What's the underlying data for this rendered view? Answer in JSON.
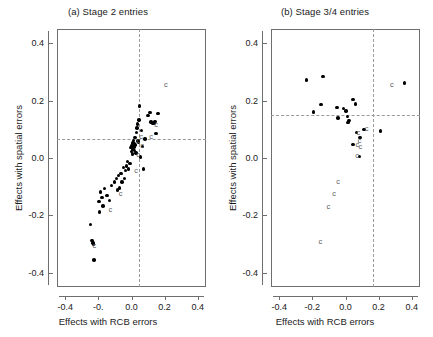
{
  "figure": {
    "width": 433,
    "height": 337,
    "background": "#ffffff",
    "point_color": "#000000",
    "label_color": "#5a5a5a",
    "axis_color": "#6e6e6e",
    "dash_color": "#9a9a9a"
  },
  "chart_data": [
    {
      "type": "scatter",
      "panel": "a",
      "title": "(a) Stage 2 entries",
      "xlabel": "Effects with RCB errors",
      "ylabel": "Effects with spatial errors",
      "xlim": [
        -0.45,
        0.45
      ],
      "ylim": [
        -0.45,
        0.45
      ],
      "xticks": [
        -0.4,
        -0.2,
        0.0,
        0.2,
        0.4
      ],
      "xticklabels": [
        "-0.4",
        "-0.",
        "0.0",
        "0.2",
        "0.4"
      ],
      "yticks": [
        -0.4,
        -0.2,
        0.0,
        0.2,
        0.4
      ],
      "yticklabels": [
        "-0.4",
        "-0.2",
        "0.0",
        "0.2",
        "0.4"
      ],
      "grid": false,
      "legend": "none",
      "reference_lines": {
        "vertical_x": 0.045,
        "horizontal_y": 0.068,
        "style": "dashed"
      },
      "points": [
        [
          -0.248,
          -0.232
        ],
        [
          -0.238,
          -0.288
        ],
        [
          -0.232,
          -0.297
        ],
        [
          -0.228,
          -0.302
        ],
        [
          -0.226,
          -0.356
        ],
        [
          -0.196,
          -0.152
        ],
        [
          -0.193,
          -0.188
        ],
        [
          -0.186,
          -0.118
        ],
        [
          -0.178,
          -0.137
        ],
        [
          -0.172,
          -0.168
        ],
        [
          -0.162,
          -0.106
        ],
        [
          -0.148,
          -0.131
        ],
        [
          -0.132,
          -0.148
        ],
        [
          -0.121,
          -0.096
        ],
        [
          -0.104,
          -0.084
        ],
        [
          -0.092,
          -0.072
        ],
        [
          -0.086,
          -0.112
        ],
        [
          -0.08,
          -0.061
        ],
        [
          -0.072,
          -0.104
        ],
        [
          -0.064,
          -0.054
        ],
        [
          -0.058,
          -0.084
        ],
        [
          -0.048,
          -0.034
        ],
        [
          -0.042,
          -0.071
        ],
        [
          -0.036,
          -0.044
        ],
        [
          -0.03,
          -0.028
        ],
        [
          -0.024,
          -0.012
        ],
        [
          -0.018,
          -0.038
        ],
        [
          -0.01,
          -0.019
        ],
        [
          -0.004,
          0.036
        ],
        [
          0.0,
          0.022
        ],
        [
          0.004,
          0.044
        ],
        [
          0.006,
          0.014
        ],
        [
          0.008,
          0.053
        ],
        [
          0.01,
          0.03
        ],
        [
          0.012,
          0.062
        ],
        [
          0.014,
          0.038
        ],
        [
          0.016,
          0.05
        ],
        [
          0.018,
          0.026
        ],
        [
          0.02,
          0.072
        ],
        [
          0.022,
          0.046
        ],
        [
          0.026,
          0.018
        ],
        [
          0.03,
          0.09
        ],
        [
          0.034,
          0.104
        ],
        [
          0.038,
          0.118
        ],
        [
          0.04,
          0.06
        ],
        [
          0.044,
          0.056
        ],
        [
          0.046,
          0.132
        ],
        [
          0.05,
          0.182
        ],
        [
          0.054,
          0.003
        ],
        [
          0.062,
          0.096
        ],
        [
          0.068,
          0.04
        ],
        [
          0.074,
          -0.038
        ],
        [
          0.082,
          0.066
        ],
        [
          0.1,
          0.148
        ],
        [
          0.112,
          0.158
        ],
        [
          0.118,
          0.126
        ],
        [
          0.128,
          0.12
        ],
        [
          0.136,
          0.122
        ],
        [
          0.142,
          0.128
        ],
        [
          0.148,
          0.086
        ],
        [
          0.16,
          0.156
        ]
      ],
      "char_labels": [
        {
          "text": "c",
          "x": 0.208,
          "y": 0.256
        },
        {
          "text": "c",
          "x": 0.148,
          "y": 0.116
        },
        {
          "text": "c",
          "x": 0.118,
          "y": 0.074
        },
        {
          "text": "c",
          "x": 0.058,
          "y": 0.072
        },
        {
          "text": "c",
          "x": 0.042,
          "y": 0.06
        },
        {
          "text": "c",
          "x": 0.064,
          "y": 0.042
        },
        {
          "text": "c",
          "x": 0.04,
          "y": 0.012
        },
        {
          "text": "c",
          "x": 0.028,
          "y": -0.044
        },
        {
          "text": "c",
          "x": -0.066,
          "y": -0.124
        },
        {
          "text": "c",
          "x": -0.128,
          "y": -0.182
        },
        {
          "text": "c",
          "x": -0.224,
          "y": -0.306
        }
      ]
    },
    {
      "type": "scatter",
      "panel": "b",
      "title": "(b) Stage 3/4 entries",
      "xlabel": "Effects with RCB errors",
      "ylabel": "Effects with spatial errors",
      "xlim": [
        -0.45,
        0.45
      ],
      "ylim": [
        -0.45,
        0.45
      ],
      "xticks": [
        -0.4,
        -0.2,
        0.0,
        0.2,
        0.4
      ],
      "xticklabels": [
        "-0.4",
        "-0.2",
        "0.0",
        "0.2",
        "0.4"
      ],
      "yticks": [
        -0.4,
        -0.2,
        0.0,
        0.2,
        0.4
      ],
      "yticklabels": [
        "-0.4",
        "-0.2",
        "0.0",
        "0.2",
        "0.4"
      ],
      "grid": false,
      "legend": "none",
      "reference_lines": {
        "vertical_x": 0.165,
        "horizontal_y": 0.15,
        "style": "dashed"
      },
      "points": [
        [
          -0.234,
          0.272
        ],
        [
          -0.192,
          0.16
        ],
        [
          -0.148,
          0.186
        ],
        [
          -0.136,
          0.284
        ],
        [
          -0.052,
          0.176
        ],
        [
          -0.046,
          0.14
        ],
        [
          0.004,
          0.164
        ],
        [
          0.012,
          0.144
        ],
        [
          -0.012,
          0.172
        ],
        [
          0.022,
          0.13
        ],
        [
          0.016,
          0.124
        ],
        [
          0.046,
          0.204
        ],
        [
          0.062,
          0.188
        ],
        [
          0.046,
          0.048
        ],
        [
          0.066,
          0.09
        ],
        [
          0.088,
          0.072
        ],
        [
          0.112,
          0.1
        ],
        [
          0.084,
          0.006
        ],
        [
          0.21,
          0.094
        ],
        [
          0.356,
          0.262
        ]
      ],
      "char_labels": [
        {
          "text": "c",
          "x": 0.28,
          "y": 0.254
        },
        {
          "text": "c",
          "x": 0.128,
          "y": 0.102
        },
        {
          "text": "c",
          "x": 0.078,
          "y": 0.086
        },
        {
          "text": "c",
          "x": 0.084,
          "y": 0.06
        },
        {
          "text": "c",
          "x": 0.072,
          "y": 0.046
        },
        {
          "text": "c",
          "x": 0.09,
          "y": 0.04
        },
        {
          "text": "c",
          "x": 0.07,
          "y": 0.006
        },
        {
          "text": "c",
          "x": -0.044,
          "y": -0.084
        },
        {
          "text": "c",
          "x": -0.068,
          "y": -0.124
        },
        {
          "text": "c",
          "x": -0.104,
          "y": -0.172
        },
        {
          "text": "c",
          "x": -0.152,
          "y": -0.292
        }
      ]
    }
  ]
}
